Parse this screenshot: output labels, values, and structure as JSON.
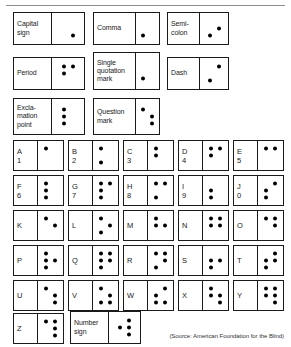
{
  "document": {
    "source_note": "(Source: American Foundation for the Blind)"
  },
  "punctuation": [
    {
      "name": "capital-sign",
      "label": "Capital\nsign",
      "dots": [
        0,
        0,
        0,
        0,
        0,
        1
      ]
    },
    {
      "name": "comma",
      "label": "Comma",
      "dots": [
        0,
        0,
        1,
        0,
        0,
        0
      ]
    },
    {
      "name": "semicolon",
      "label": "Semi-\ncolon",
      "dots": [
        0,
        0,
        1,
        0,
        1,
        0
      ]
    },
    {
      "name": "period",
      "label": "Period",
      "dots": [
        1,
        1,
        0,
        1,
        0,
        0
      ]
    },
    {
      "name": "single-quotation-mark",
      "label": "Single\nquotation\nmark",
      "dots": [
        0,
        0,
        1,
        0,
        0,
        0
      ]
    },
    {
      "name": "dash",
      "label": "Dash",
      "dots": [
        0,
        0,
        1,
        1,
        0,
        0
      ]
    },
    {
      "name": "exclamation-point",
      "label": "Excla-\nmation\npoint",
      "dots": [
        1,
        1,
        1,
        0,
        0,
        0
      ]
    },
    {
      "name": "question-mark",
      "label": "Question\nmark",
      "dots": [
        1,
        0,
        0,
        0,
        1,
        1
      ]
    }
  ],
  "alphabet": [
    {
      "name": "letter-a",
      "label": "A\n1",
      "dots": [
        1,
        0,
        0,
        0,
        0,
        0
      ]
    },
    {
      "name": "letter-b",
      "label": "B\n2",
      "dots": [
        1,
        0,
        1,
        0,
        0,
        0
      ]
    },
    {
      "name": "letter-c",
      "label": "C\n3",
      "dots": [
        1,
        1,
        0,
        0,
        0,
        0
      ]
    },
    {
      "name": "letter-d",
      "label": "D\n4",
      "dots": [
        1,
        1,
        0,
        1,
        0,
        0
      ]
    },
    {
      "name": "letter-e",
      "label": "E\n5",
      "dots": [
        1,
        0,
        0,
        1,
        0,
        0
      ]
    },
    {
      "name": "letter-f",
      "label": "F\n6",
      "dots": [
        1,
        1,
        1,
        0,
        0,
        0
      ]
    },
    {
      "name": "letter-g",
      "label": "G\n7",
      "dots": [
        1,
        1,
        1,
        1,
        0,
        0
      ]
    },
    {
      "name": "letter-h",
      "label": "H\n8",
      "dots": [
        1,
        0,
        1,
        1,
        0,
        0
      ]
    },
    {
      "name": "letter-i",
      "label": "I\n9",
      "dots": [
        0,
        1,
        1,
        0,
        0,
        0
      ]
    },
    {
      "name": "letter-j",
      "label": "J\n0",
      "dots": [
        0,
        1,
        1,
        1,
        0,
        0
      ]
    },
    {
      "name": "letter-k",
      "label": "K",
      "dots": [
        1,
        0,
        0,
        0,
        1,
        0
      ]
    },
    {
      "name": "letter-l",
      "label": "L",
      "dots": [
        1,
        0,
        1,
        0,
        1,
        0
      ]
    },
    {
      "name": "letter-m",
      "label": "M",
      "dots": [
        1,
        1,
        0,
        0,
        1,
        0
      ]
    },
    {
      "name": "letter-n",
      "label": "N",
      "dots": [
        1,
        1,
        0,
        1,
        1,
        0
      ]
    },
    {
      "name": "letter-o",
      "label": "O",
      "dots": [
        1,
        0,
        0,
        1,
        1,
        0
      ]
    },
    {
      "name": "letter-p",
      "label": "P",
      "dots": [
        1,
        1,
        1,
        0,
        1,
        0
      ]
    },
    {
      "name": "letter-q",
      "label": "Q",
      "dots": [
        1,
        1,
        1,
        1,
        1,
        0
      ]
    },
    {
      "name": "letter-r",
      "label": "R",
      "dots": [
        1,
        0,
        1,
        1,
        1,
        0
      ]
    },
    {
      "name": "letter-s",
      "label": "S",
      "dots": [
        0,
        1,
        1,
        0,
        1,
        0
      ]
    },
    {
      "name": "letter-t",
      "label": "T",
      "dots": [
        0,
        1,
        1,
        1,
        1,
        0
      ]
    },
    {
      "name": "letter-u",
      "label": "U",
      "dots": [
        1,
        0,
        0,
        0,
        1,
        1
      ]
    },
    {
      "name": "letter-v",
      "label": "V",
      "dots": [
        1,
        0,
        1,
        0,
        1,
        1
      ]
    },
    {
      "name": "letter-w",
      "label": "W",
      "dots": [
        0,
        1,
        1,
        1,
        0,
        1
      ]
    },
    {
      "name": "letter-x",
      "label": "X",
      "dots": [
        1,
        1,
        0,
        0,
        1,
        1
      ]
    },
    {
      "name": "letter-y",
      "label": "Y",
      "dots": [
        1,
        1,
        0,
        1,
        1,
        1
      ]
    },
    {
      "name": "letter-z",
      "label": "Z",
      "dots": [
        1,
        0,
        0,
        1,
        1,
        1
      ]
    }
  ],
  "number_sign": {
    "name": "number-sign",
    "label": "Number\nsign",
    "dots": [
      0,
      1,
      0,
      1,
      1,
      1
    ]
  }
}
